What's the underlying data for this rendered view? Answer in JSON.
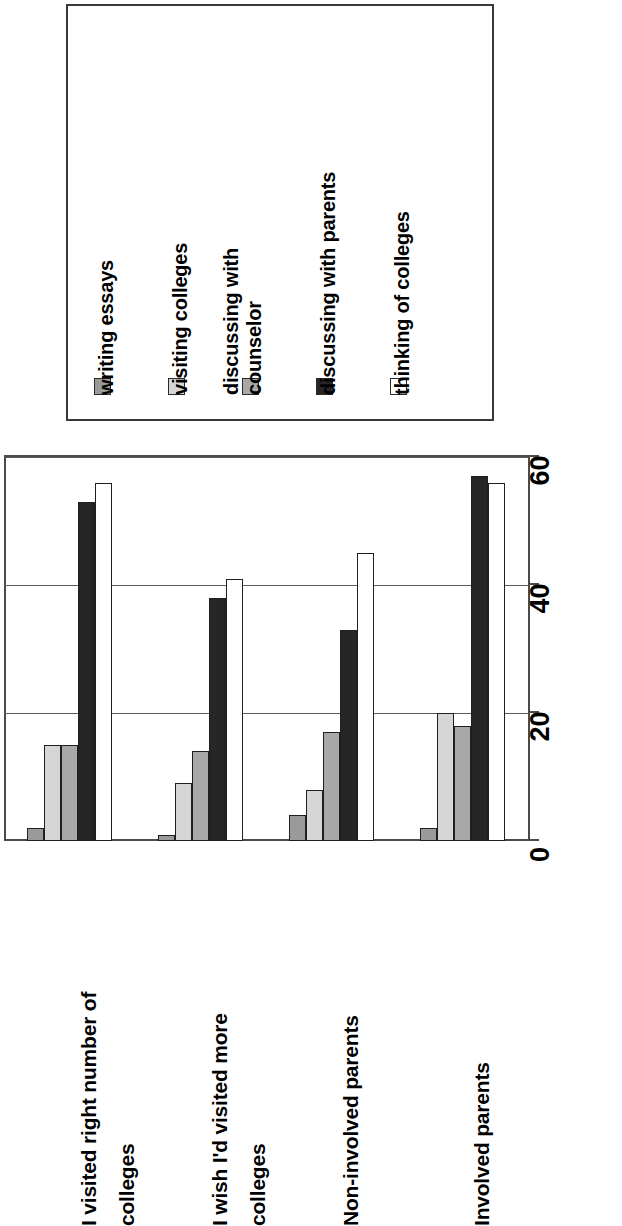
{
  "chart_data": {
    "type": "bar",
    "title": "",
    "xlabel": "",
    "ylabel": "",
    "orientation": "rotated-90-ccw",
    "grid": true,
    "legend_position": "top",
    "ylim": [
      0,
      60
    ],
    "yticks": [
      "0",
      "20",
      "40",
      "60"
    ],
    "categories": [
      "I visited right number of\ncolleges",
      "I wish I'd visited more\ncolleges",
      "Non-involved parents",
      "Involved parents"
    ],
    "series": [
      {
        "name": "writing essays",
        "color": "#9a9a9a",
        "values": [
          2,
          1,
          4,
          2
        ]
      },
      {
        "name": "visiting colleges",
        "color": "#d6d6d6",
        "values": [
          15,
          9,
          8,
          20
        ]
      },
      {
        "name": "discussing with\ncounselor",
        "color": "#a8a8a8",
        "values": [
          15,
          14,
          17,
          18
        ]
      },
      {
        "name": "discussing with parents",
        "color": "#262626",
        "values": [
          53,
          38,
          33,
          57
        ]
      },
      {
        "name": "thinking of colleges",
        "color": "#ffffff",
        "values": [
          56,
          41,
          45,
          56
        ]
      }
    ]
  },
  "legend": {
    "entries": [
      {
        "label": "writing essays",
        "swatch": "#9a9a9a"
      },
      {
        "label": "visiting colleges",
        "swatch": "#d6d6d6"
      },
      {
        "label": "discussing with\ncounselor",
        "swatch": "#a8a8a8"
      },
      {
        "label": "discussing with parents",
        "swatch": "#262626"
      },
      {
        "label": "thinking of colleges",
        "swatch": "#ffffff"
      }
    ]
  },
  "axis": {
    "ticks": [
      {
        "label": "0",
        "value": 0
      },
      {
        "label": "20",
        "value": 20
      },
      {
        "label": "40",
        "value": 40
      },
      {
        "label": "60",
        "value": 60
      }
    ]
  }
}
